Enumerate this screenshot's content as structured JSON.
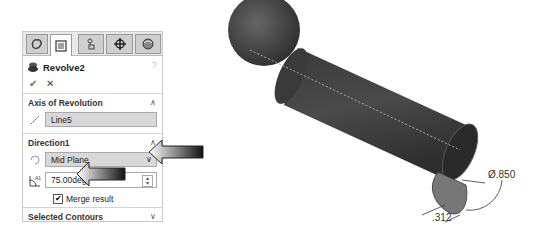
{
  "panel": {
    "tabs": [
      {
        "name": "feature-manager-icon"
      },
      {
        "name": "property-manager-icon",
        "active": true
      },
      {
        "name": "configuration-manager-icon"
      },
      {
        "name": "dimxpert-manager-icon"
      },
      {
        "name": "display-manager-icon"
      }
    ],
    "title": "Revolve2",
    "help": "?",
    "ok": "✔",
    "cancel": "✕",
    "axis_section": {
      "label": "Axis of Revolution",
      "value": "Line5"
    },
    "direction_section": {
      "label": "Direction1",
      "end_condition": "Mid Plane",
      "angle": "75.00deg",
      "merge_label": "Merge result",
      "merge_checked": true
    },
    "contours_section": {
      "label": "Selected Contours"
    }
  },
  "model": {
    "dim_diameter": "Ø.850",
    "dim_offset": ".312"
  }
}
